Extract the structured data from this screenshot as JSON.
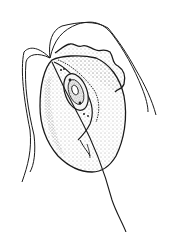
{
  "figure": {
    "style": "stippled ink line drawing",
    "colors": {
      "background": "#ffffff",
      "ink": "#1a1a1a",
      "stipple": "#555555"
    }
  }
}
